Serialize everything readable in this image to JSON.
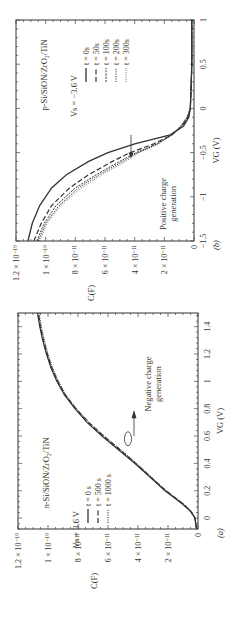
{
  "figure": {
    "rotation_deg": -90,
    "panels": [
      "a",
      "b"
    ]
  },
  "chart_data": [
    {
      "id": "a",
      "type": "line",
      "panel_label": "(a)",
      "title": "n-Si/SiON/ZrO2/TiN",
      "title_display": "n-Si/SiON/ZrO₂/TiN",
      "stress_label": "V_S = 3.6 V",
      "stress_display": "Vs = 3.6 V",
      "xlabel": "V_G (V)",
      "xlabel_display": "VG (V)",
      "ylabel": "C(F)",
      "xlim": [
        -0.08,
        1.5
      ],
      "ylim": [
        0,
        1.2e-10
      ],
      "xticks": [
        0,
        0.2,
        0.4,
        0.6,
        0.8,
        1,
        1.2,
        1.4
      ],
      "xtick_labels": [
        "0",
        "0.2",
        "0.4",
        "0.6",
        "0.8",
        "1",
        "1.2",
        "1.4"
      ],
      "yticks": [
        0,
        2e-11,
        4e-11,
        6e-11,
        8e-11,
        1e-10,
        1.2e-10
      ],
      "ytick_labels": [
        "0",
        "2 × 10⁻¹¹",
        "4 × 10⁻¹¹",
        "6 × 10⁻¹¹",
        "8 × 10⁻¹¹",
        "1 × 10⁻¹⁰",
        "1.2 × 10⁻¹⁰"
      ],
      "annotation": "Negative charge generation",
      "annotation_lines": [
        "Negative charge",
        "generation"
      ],
      "legend": [
        "t = 0 s",
        "t = 500 s",
        "t = 1000 s"
      ],
      "series": [
        {
          "name": "t = 0 s",
          "style": "solid",
          "x": [
            -0.08,
            0.0,
            0.05,
            0.1,
            0.15,
            0.2,
            0.3,
            0.4,
            0.5,
            0.6,
            0.7,
            0.8,
            0.9,
            1.0,
            1.1,
            1.2,
            1.3,
            1.4,
            1.5
          ],
          "y": [
            1e-12,
            2e-12,
            5e-12,
            1e-11,
            1.6e-11,
            2.2e-11,
            3.2e-11,
            4.2e-11,
            5.3e-11,
            6.4e-11,
            7.4e-11,
            8.2e-11,
            8.9e-11,
            9.4e-11,
            9.8e-11,
            1.01e-10,
            1.035e-10,
            1.055e-10,
            1.07e-10
          ]
        },
        {
          "name": "t = 500 s",
          "style": "dashed",
          "x": [
            -0.08,
            0.0,
            0.05,
            0.1,
            0.15,
            0.2,
            0.3,
            0.4,
            0.5,
            0.6,
            0.7,
            0.8,
            0.9,
            1.0,
            1.1,
            1.2,
            1.3,
            1.4,
            1.5
          ],
          "y": [
            1e-12,
            2e-12,
            5e-12,
            9.5e-12,
            1.55e-11,
            2.15e-11,
            3.15e-11,
            4.15e-11,
            5.2e-11,
            6.3e-11,
            7.3e-11,
            8.15e-11,
            8.85e-11,
            9.35e-11,
            9.75e-11,
            1.005e-10,
            1.03e-10,
            1.05e-10,
            1.065e-10
          ]
        },
        {
          "name": "t = 1000 s",
          "style": "dotted",
          "x": [
            -0.08,
            0.0,
            0.05,
            0.1,
            0.15,
            0.2,
            0.3,
            0.4,
            0.5,
            0.6,
            0.7,
            0.8,
            0.9,
            1.0,
            1.1,
            1.2,
            1.3,
            1.4,
            1.5
          ],
          "y": [
            1e-12,
            2e-12,
            4.5e-12,
            9e-12,
            1.5e-11,
            2.1e-11,
            3.1e-11,
            4.1e-11,
            5.15e-11,
            6.25e-11,
            7.25e-11,
            8.1e-11,
            8.8e-11,
            9.3e-11,
            9.7e-11,
            1e-10,
            1.025e-10,
            1.045e-10,
            1.06e-10
          ]
        }
      ]
    },
    {
      "id": "b",
      "type": "line",
      "panel_label": "(b)",
      "title": "p-Si/SiON/ZrO2/TiN",
      "title_display": "p-Si/SiON/ZrO₂/TiN",
      "stress_label": "V_s = -3.6 V",
      "stress_display": "Vs = −3.6 V",
      "xlabel": "V_G (V)",
      "xlabel_display": "VG (V)",
      "ylabel": "C(F)",
      "xlim": [
        -1.5,
        1.0
      ],
      "ylim": [
        0,
        1.2e-10
      ],
      "xticks": [
        -1.5,
        -1,
        -0.5,
        0,
        0.5,
        1
      ],
      "xtick_labels": [
        "−1.5",
        "−1",
        "−0.5",
        "0",
        "0.5",
        "1"
      ],
      "yticks": [
        0,
        2e-11,
        4e-11,
        6e-11,
        8e-11,
        1e-10,
        1.2e-10
      ],
      "ytick_labels": [
        "0",
        "2 × 10⁻¹¹",
        "4 × 10⁻¹¹",
        "6 × 10⁻¹¹",
        "8 × 10⁻¹¹",
        "1 × 10⁻¹⁰",
        "1.2 × 10⁻¹⁰"
      ],
      "annotation": "Positive charge generation",
      "annotation_lines": [
        "Positive charge",
        "generation"
      ],
      "legend": [
        "t = 0s",
        "t = 50s",
        "t = 100s",
        "t = 200s",
        "t = 300s"
      ],
      "series": [
        {
          "name": "t = 0s",
          "style": "solid",
          "x": [
            -1.5,
            -1.3,
            -1.1,
            -0.9,
            -0.75,
            -0.6,
            -0.5,
            -0.4,
            -0.35,
            -0.3,
            -0.2,
            -0.1,
            0.0,
            0.2,
            0.5,
            1.0
          ],
          "y": [
            1.12e-10,
            1.09e-10,
            1.04e-10,
            9.6e-11,
            8.6e-11,
            7.1e-11,
            5.8e-11,
            4e-11,
            2.8e-11,
            1.6e-11,
            7e-12,
            3.5e-12,
            2.5e-12,
            2e-12,
            1.5e-12,
            1.5e-12
          ]
        },
        {
          "name": "t = 50s",
          "style": "dashed",
          "x": [
            -1.5,
            -1.3,
            -1.1,
            -0.9,
            -0.75,
            -0.6,
            -0.5,
            -0.45,
            -0.4,
            -0.3,
            -0.2,
            -0.1,
            0.0,
            0.2,
            0.5,
            1.0
          ],
          "y": [
            1.08e-10,
            1.03e-10,
            9.6e-11,
            8.4e-11,
            7.1e-11,
            5.5e-11,
            4.3e-11,
            3.5e-11,
            2.7e-11,
            1.5e-11,
            8e-12,
            4e-12,
            2.5e-12,
            2e-12,
            1.5e-12,
            1.5e-12
          ]
        },
        {
          "name": "t = 100s",
          "style": "dashdot",
          "x": [
            -1.5,
            -1.3,
            -1.1,
            -0.9,
            -0.75,
            -0.6,
            -0.5,
            -0.45,
            -0.4,
            -0.3,
            -0.2,
            -0.1,
            0.0,
            0.2,
            0.5,
            1.0
          ],
          "y": [
            1.06e-10,
            1.01e-10,
            9.3e-11,
            8e-11,
            6.6e-11,
            5e-11,
            3.9e-11,
            3.2e-11,
            2.5e-11,
            1.5e-11,
            8.5e-12,
            4.5e-12,
            2.5e-12,
            2e-12,
            1.5e-12,
            1.5e-12
          ]
        },
        {
          "name": "t = 200s",
          "style": "dotted",
          "x": [
            -1.5,
            -1.3,
            -1.1,
            -0.9,
            -0.75,
            -0.6,
            -0.5,
            -0.45,
            -0.4,
            -0.3,
            -0.2,
            -0.1,
            0.0,
            0.2,
            0.5,
            1.0
          ],
          "y": [
            1.05e-10,
            1e-10,
            9.1e-11,
            7.8e-11,
            6.4e-11,
            4.8e-11,
            3.8e-11,
            3.1e-11,
            2.45e-11,
            1.5e-11,
            9e-12,
            4.5e-12,
            2.5e-12,
            2e-12,
            1.5e-12,
            1.5e-12
          ]
        },
        {
          "name": "t = 300s",
          "style": "finedotted",
          "x": [
            -1.5,
            -1.3,
            -1.1,
            -0.9,
            -0.75,
            -0.6,
            -0.5,
            -0.45,
            -0.4,
            -0.3,
            -0.2,
            -0.1,
            0.0,
            0.2,
            0.5,
            1.0
          ],
          "y": [
            1.04e-10,
            9.9e-11,
            9e-11,
            7.6e-11,
            6.2e-11,
            4.6e-11,
            3.7e-11,
            3e-11,
            2.4e-11,
            1.5e-11,
            9e-12,
            5e-12,
            2.5e-12,
            2e-12,
            1.5e-12,
            1.5e-12
          ]
        }
      ]
    }
  ]
}
